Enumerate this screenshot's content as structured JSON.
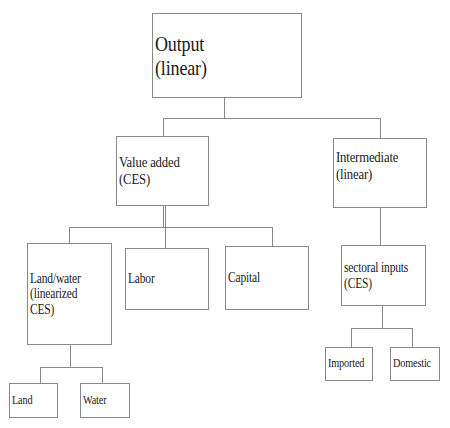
{
  "diagram": {
    "nodes": {
      "output": {
        "label": "Output\n(linear)"
      },
      "value_added": {
        "label": "Value added\n(CES)"
      },
      "intermediate": {
        "label": "Intermediate\n(linear)"
      },
      "land_water": {
        "label": "Land/water\n(linearized\nCES)"
      },
      "labor": {
        "label": "Labor"
      },
      "capital": {
        "label": "Capital"
      },
      "sectoral_inputs": {
        "label": "sectoral inputs\n(CES)"
      },
      "imported": {
        "label": "Imported"
      },
      "domestic": {
        "label": "Domestic"
      },
      "land": {
        "label": "Land"
      },
      "water": {
        "label": "Water"
      }
    },
    "edges": [
      {
        "from": "output",
        "to": "value_added"
      },
      {
        "from": "output",
        "to": "intermediate"
      },
      {
        "from": "value_added",
        "to": "land_water"
      },
      {
        "from": "value_added",
        "to": "labor"
      },
      {
        "from": "value_added",
        "to": "capital"
      },
      {
        "from": "intermediate",
        "to": "sectoral_inputs"
      },
      {
        "from": "sectoral_inputs",
        "to": "imported"
      },
      {
        "from": "sectoral_inputs",
        "to": "domestic"
      },
      {
        "from": "land_water",
        "to": "land"
      },
      {
        "from": "land_water",
        "to": "water"
      }
    ]
  }
}
